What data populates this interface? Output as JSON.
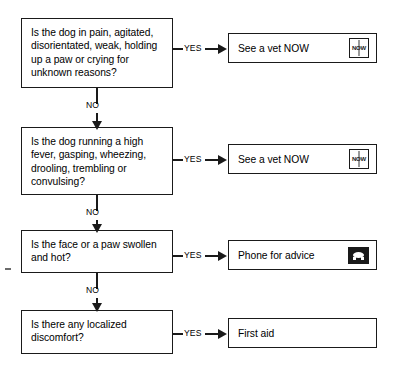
{
  "chart_data": {
    "type": "diagram",
    "orientation": "top-to-bottom with yes-branches to the right",
    "yes_label": "YES",
    "no_label": "NO",
    "nodes": [
      {
        "id": "q1",
        "kind": "question",
        "text": "Is the dog in pain, agitated,\ndisorientated, weak, holding\nup a paw or crying for\nunknown reasons?",
        "yes_target": "a1",
        "no_target": "q2"
      },
      {
        "id": "q2",
        "kind": "question",
        "text": "Is the dog running a high\nfever, gasping, wheezing,\ndrooling, trembling or\nconvulsing?",
        "yes_target": "a2",
        "no_target": "q3"
      },
      {
        "id": "q3",
        "kind": "question",
        "text": "Is the face or a paw swollen\nand hot?",
        "yes_target": "a3",
        "no_target": "q4"
      },
      {
        "id": "q4",
        "kind": "question",
        "text": "Is there any localized\ndiscomfort?",
        "yes_target": "a4",
        "no_target": null
      },
      {
        "id": "a1",
        "kind": "action",
        "text": "See a vet NOW",
        "icon": "now-urgent-icon",
        "icon_text": "NOW"
      },
      {
        "id": "a2",
        "kind": "action",
        "text": "See a vet NOW",
        "icon": "now-urgent-icon",
        "icon_text": "NOW"
      },
      {
        "id": "a3",
        "kind": "action",
        "text": "Phone for advice",
        "icon": "telephone-icon",
        "icon_text": ""
      },
      {
        "id": "a4",
        "kind": "action",
        "text": "First aid",
        "icon": "none",
        "icon_text": ""
      }
    ],
    "colors": {
      "background": "#ffffff",
      "stroke": "#1a1a1a",
      "text": "#000000"
    }
  }
}
